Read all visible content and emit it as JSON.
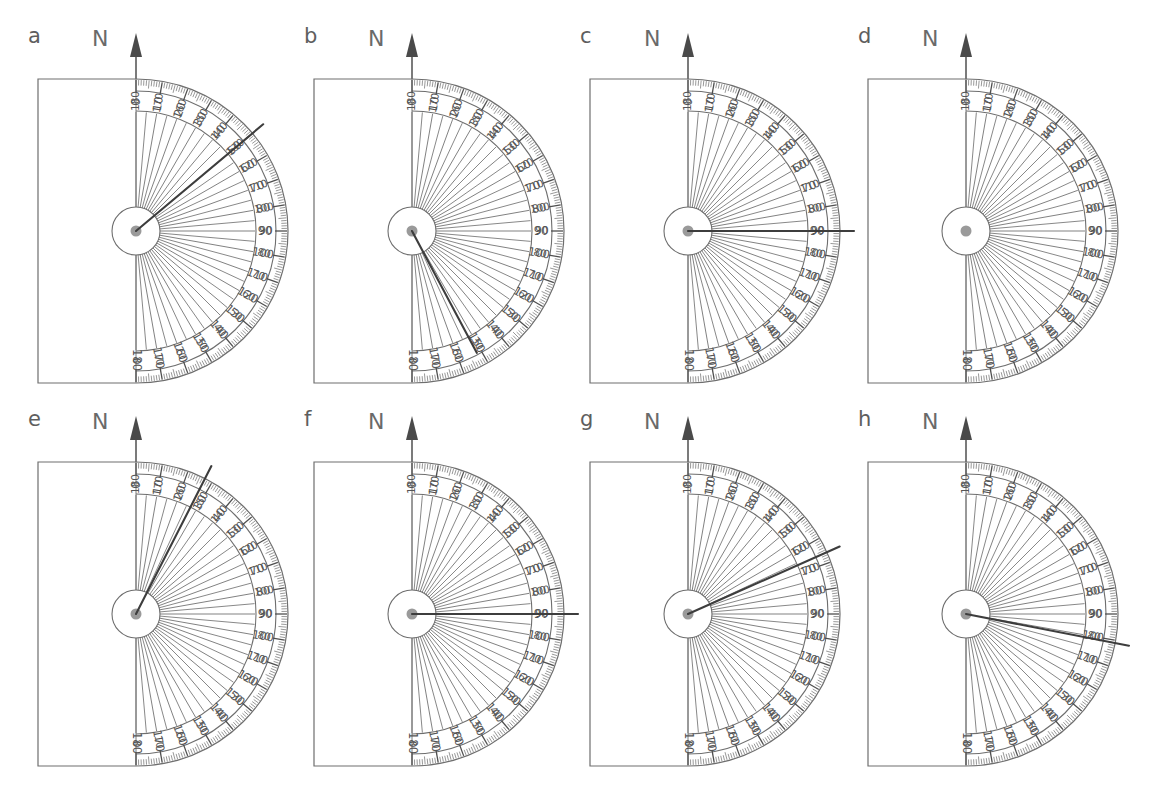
{
  "page": {
    "header_partial_text": "",
    "background": "#ffffff",
    "ink": "#555555",
    "hub_color": "#9a9a9a"
  },
  "legend": {
    "north_label": "N",
    "north_arrow_icon": "north-arrow-icon"
  },
  "scale": {
    "outer_labels": [
      "0",
      "10",
      "20",
      "30",
      "40",
      "50",
      "60",
      "70",
      "80",
      "90",
      "100",
      "110",
      "120",
      "130",
      "140",
      "150",
      "160",
      "170",
      "180"
    ],
    "inner_labels": [
      "180",
      "170",
      "160",
      "150",
      "140",
      "130",
      "120",
      "110",
      "100",
      "90",
      "80",
      "70",
      "60",
      "50",
      "40",
      "30",
      "20",
      "10",
      "0"
    ],
    "major_step": 10,
    "minor_step": 1,
    "range": [
      0,
      180
    ],
    "units": "degrees"
  },
  "panels": [
    {
      "id": "a",
      "letter": "a",
      "north": "N",
      "bearing": 50,
      "has_bearing": true,
      "bearing_style": "bold-extended"
    },
    {
      "id": "b",
      "letter": "b",
      "north": "N",
      "bearing": 152,
      "has_bearing": true,
      "bearing_style": "bold"
    },
    {
      "id": "c",
      "letter": "c",
      "north": "N",
      "bearing": 90,
      "has_bearing": true,
      "bearing_style": "bold-extended"
    },
    {
      "id": "d",
      "letter": "d",
      "north": "N",
      "bearing": null,
      "has_bearing": false,
      "bearing_style": "none"
    },
    {
      "id": "e",
      "letter": "e",
      "north": "N",
      "bearing": 27,
      "has_bearing": true,
      "bearing_style": "bold-extended"
    },
    {
      "id": "f",
      "letter": "f",
      "north": "N",
      "bearing": 90,
      "has_bearing": true,
      "bearing_style": "bold-extended"
    },
    {
      "id": "g",
      "letter": "g",
      "north": "N",
      "bearing": 66,
      "has_bearing": true,
      "bearing_style": "bold-extended"
    },
    {
      "id": "h",
      "letter": "h",
      "north": "N",
      "bearing": 101,
      "has_bearing": true,
      "bearing_style": "bold-extended"
    }
  ],
  "layout": {
    "columns": 4,
    "rows": 2,
    "panel_origins": [
      {
        "x": 20,
        "y": 24
      },
      {
        "x": 296,
        "y": 24
      },
      {
        "x": 572,
        "y": 24
      },
      {
        "x": 850,
        "y": 24
      },
      {
        "x": 20,
        "y": 407
      },
      {
        "x": 296,
        "y": 407
      },
      {
        "x": 572,
        "y": 407
      },
      {
        "x": 850,
        "y": 407
      }
    ],
    "protractor": {
      "center_dx": 116,
      "center_dy": 207,
      "radius_outer": 152,
      "radius_scale_outer": 140,
      "radius_scale_inner": 120,
      "radius_hub": 24,
      "baseline_left_dx": 98
    }
  }
}
